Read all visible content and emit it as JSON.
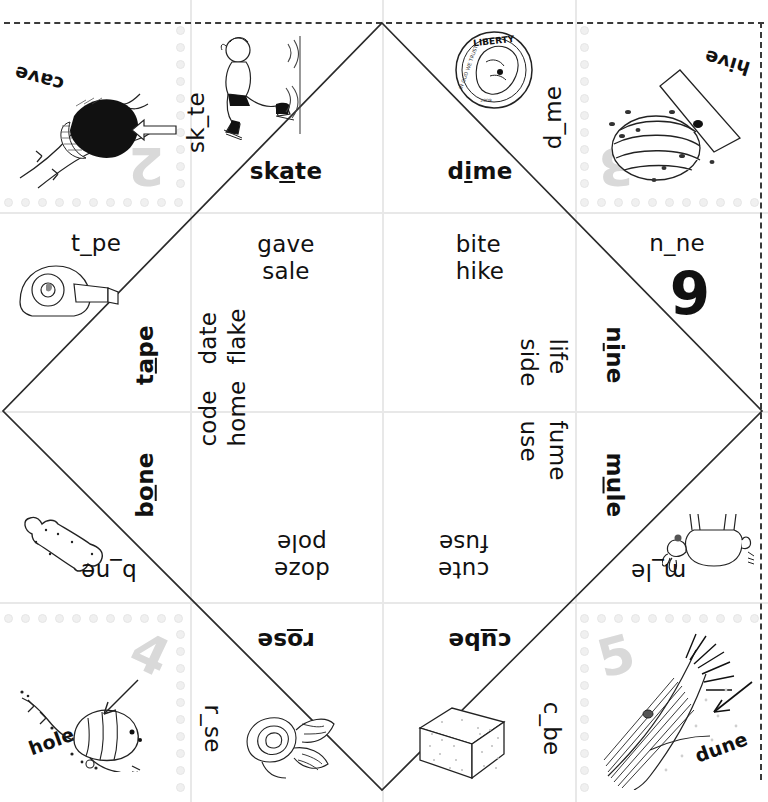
{
  "worksheet": {
    "title": "Long Vowel Fortune Teller",
    "type": "paper-folding cootie catcher",
    "grid": {
      "columns": 4,
      "rows": 4
    },
    "colors": {
      "ink": "#111111",
      "cutline": "#3a3a3a",
      "gridline": "#e8e8e8",
      "watermark": "#d9d9d9",
      "dot": "#f0f0f0"
    }
  },
  "corners": {
    "top_left": {
      "number": "2",
      "word": "cave",
      "picture": "cave-illustration",
      "rotation": 180
    },
    "top_right": {
      "number": "3",
      "word": "hive",
      "picture": "beehive-illustration",
      "rotation": 180
    },
    "bottom_left": {
      "number": "4",
      "word": "hole",
      "picture": "worm-in-hole-illustration",
      "rotation": 0
    },
    "bottom_right": {
      "number": "5",
      "word": "dune",
      "picture": "sand-dune-illustration",
      "rotation": 0
    }
  },
  "flaps": {
    "top_left_outer": {
      "prompt": "sk_te",
      "picture": "skater-illustration",
      "answer_prefix": "sk",
      "answer_vowel": "a",
      "answer_suffix": "te",
      "answer": "skate"
    },
    "top_right_outer": {
      "prompt": "d_me",
      "picture": "dime-coin-illustration",
      "answer_prefix": "d",
      "answer_vowel": "i",
      "answer_suffix": "me",
      "answer": "dime"
    },
    "left_upper_outer": {
      "prompt": "t_pe",
      "picture": "tape-dispenser-illustration",
      "answer_prefix": "t",
      "answer_vowel": "a",
      "answer_suffix": "pe",
      "answer": "tape"
    },
    "right_upper_outer": {
      "prompt": "n_ne",
      "picture": "number-nine-illustration",
      "answer_prefix": "n",
      "answer_vowel": "i",
      "answer_suffix": "ne",
      "answer": "nine"
    },
    "left_lower_outer": {
      "prompt": "b_ne",
      "picture": "bone-illustration",
      "answer_prefix": "b",
      "answer_vowel": "o",
      "answer_suffix": "ne",
      "answer": "bone"
    },
    "right_lower_outer": {
      "prompt": "m_le",
      "picture": "mule-illustration",
      "answer_prefix": "m",
      "answer_vowel": "u",
      "answer_suffix": "le",
      "answer": "mule"
    },
    "bottom_left_outer": {
      "prompt": "r_se",
      "picture": "rose-illustration",
      "answer_prefix": "r",
      "answer_vowel": "o",
      "answer_suffix": "se",
      "answer": "rose"
    },
    "bottom_right_outer": {
      "prompt": "c_be",
      "picture": "cube-illustration",
      "answer_prefix": "c",
      "answer_vowel": "u",
      "answer_suffix": "be",
      "answer": "cube"
    }
  },
  "wordlists": {
    "skate_pair": {
      "line1": "gave",
      "line2": "sale"
    },
    "dime_pair": {
      "line1": "bite",
      "line2": "hike"
    },
    "tape_pair": {
      "line1": "date",
      "line2": "flake"
    },
    "nine_pair": {
      "line1": "life",
      "line2": "side"
    },
    "bone_pair": {
      "line1": "code",
      "line2": "home"
    },
    "mule_pair": {
      "line1": "fume",
      "line2": "use"
    },
    "rose_pair": {
      "line1": "pole",
      "line2": "doze"
    },
    "cube_pair": {
      "line1": "cute",
      "line2": "fuse"
    }
  }
}
